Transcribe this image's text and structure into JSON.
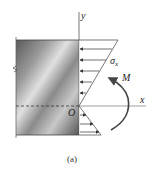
{
  "figure": {
    "caption": "(a)",
    "labels": {
      "y_axis": "y",
      "x_axis": "x",
      "origin": "O",
      "stress": "σ",
      "stress_sub": "x",
      "moment": "M"
    },
    "colors": {
      "line": "#555555",
      "arrow": "#333333",
      "beam_dark": "#4a4a4a",
      "beam_light": "#d8d8d8"
    }
  }
}
